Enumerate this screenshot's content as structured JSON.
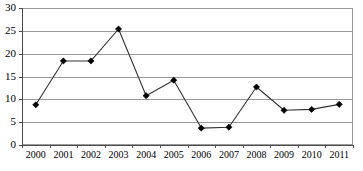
{
  "chart_data": {
    "type": "line",
    "title": "",
    "subtitle": "",
    "xlabel": "",
    "ylabel": "",
    "categories": [
      "2000",
      "2001",
      "2002",
      "2003",
      "2004",
      "2005",
      "2006",
      "2007",
      "2008",
      "2009",
      "2010",
      "2011"
    ],
    "values": [
      8.8,
      18.4,
      18.4,
      25.4,
      10.8,
      14.2,
      3.7,
      3.9,
      12.7,
      7.6,
      7.8,
      8.9
    ],
    "series": [
      {
        "name": "",
        "values": [
          8.8,
          18.4,
          18.4,
          25.4,
          10.8,
          14.2,
          3.7,
          3.9,
          12.7,
          7.6,
          7.8,
          8.9
        ]
      }
    ],
    "ylim": [
      0,
      30
    ],
    "y_ticks": [
      0,
      5,
      10,
      15,
      20,
      25,
      30
    ],
    "y_tick_labels": [
      "0",
      "5",
      "10",
      "15",
      "20",
      "25",
      "30"
    ],
    "x_tick_labels": [
      "2000",
      "2001",
      "2002",
      "2003",
      "2004",
      "2005",
      "2006",
      "2007",
      "2008",
      "2009",
      "2010",
      "2011"
    ],
    "grid": true,
    "grid_axis": "y",
    "legend": false,
    "legend_position": "none",
    "marker": "diamond",
    "colors": {
      "line": "#333333",
      "marker": "#000000",
      "gridline": "#9a9a9a",
      "axis": "#4d4d4d",
      "background": "#ffffff",
      "text": "#000000"
    }
  },
  "plot": {
    "left": 22,
    "right": 353,
    "top": 8,
    "bottom": 145
  }
}
